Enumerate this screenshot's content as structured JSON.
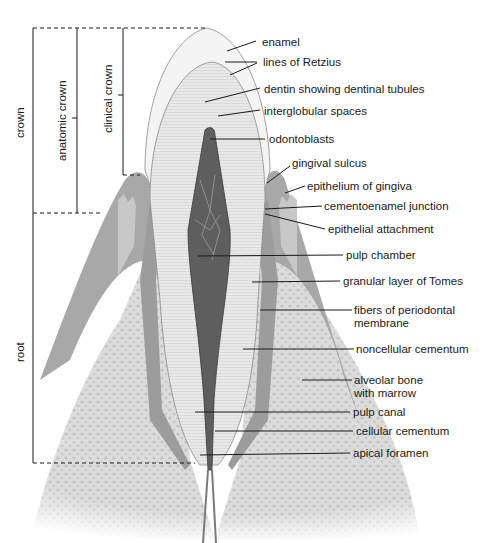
{
  "figure": {
    "colors": {
      "background": "#ffffff",
      "enamel": "#f2f2f2",
      "dentin": "#e4e4e4",
      "pulp": "#5a5a5a",
      "gingiva": "#9a9a9a",
      "bone": "#d6d6d6",
      "line": "#1a1a1a"
    }
  },
  "brackets": {
    "crown": "crown",
    "anatomic_crown": "anatomic crown",
    "clinical_crown": "clinical crown",
    "root": "root"
  },
  "labels": [
    {
      "id": "enamel",
      "text": "enamel"
    },
    {
      "id": "lines-of-retzius",
      "text": "lines of Retzius"
    },
    {
      "id": "dentin",
      "text": "dentin showing dentinal tubules"
    },
    {
      "id": "interglobular-spaces",
      "text": "interglobular spaces"
    },
    {
      "id": "odontoblasts",
      "text": "odontoblasts"
    },
    {
      "id": "gingival-sulcus",
      "text": "gingival sulcus"
    },
    {
      "id": "epithelium-of-gingiva",
      "text": "epithelium of gingiva"
    },
    {
      "id": "cementoenamel-junction",
      "text": "cementoenamel junction"
    },
    {
      "id": "epithelial-attachment",
      "text": "epithelial attachment"
    },
    {
      "id": "pulp-chamber",
      "text": "pulp chamber"
    },
    {
      "id": "granular-layer-of-tomes",
      "text": "granular layer of Tomes"
    },
    {
      "id": "fibers-of-periodontal-membrane",
      "text": "fibers of periodontal",
      "text2": "membrane"
    },
    {
      "id": "noncellular-cementum",
      "text": "noncellular cementum"
    },
    {
      "id": "alveolar-bone",
      "text": "alveolar bone",
      "text2": "with marrow"
    },
    {
      "id": "pulp-canal",
      "text": "pulp canal"
    },
    {
      "id": "cellular-cementum",
      "text": "cellular cementum"
    },
    {
      "id": "apical-foramen",
      "text": "apical foramen"
    }
  ]
}
